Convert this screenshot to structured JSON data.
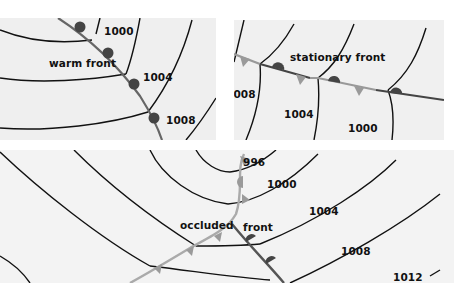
{
  "panels": [
    {
      "id": "warm",
      "front_label": "warm front",
      "isobars": [
        "1000",
        "1004",
        "1008"
      ]
    },
    {
      "id": "stationary",
      "front_label": "stationary front",
      "isobars": [
        "1008",
        "1004",
        "1000"
      ]
    },
    {
      "id": "occluded",
      "front_label_1": "occluded",
      "front_label_2": "front",
      "isobars": [
        "996",
        "1000",
        "1004",
        "1008",
        "1012"
      ]
    }
  ],
  "colors": {
    "background": "#ffffff",
    "panel": "#efefef",
    "isobar": "#111111",
    "warm_front_line": "#555555",
    "warm_front_symbol": "#444444",
    "cold_front_symbol": "#9a9a9a",
    "occluded_front_line": "#aaaaaa"
  }
}
